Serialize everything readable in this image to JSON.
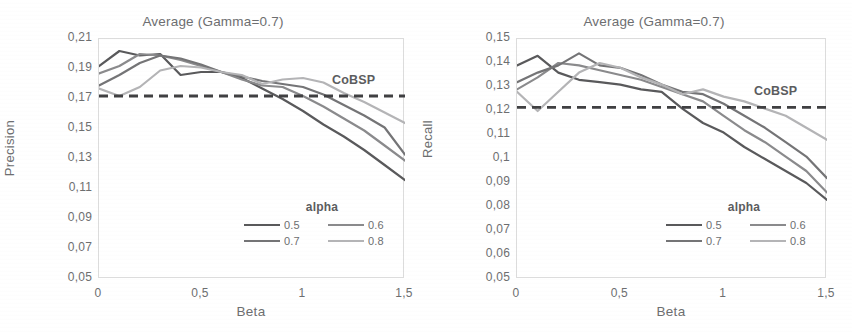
{
  "figure": {
    "panels": [
      {
        "id": "precision-panel",
        "title": "Average (Gamma=0.7)",
        "ylabel": "Precision",
        "xlabel": "Beta",
        "baseline_label": "CoBSP",
        "legend_title": "alpha"
      },
      {
        "id": "recall-panel",
        "title": "Average (Gamma=0.7)",
        "ylabel": "Recall",
        "xlabel": "Beta",
        "baseline_label": "CoBSP",
        "legend_title": "alpha"
      }
    ]
  },
  "colors": {
    "series_05": "#59595b",
    "series_06": "#8a8a8c",
    "series_07": "#747476",
    "series_08": "#b4b4b6",
    "baseline": "#3f3f41",
    "axis": "#dcdcdc",
    "text": "#6d6e70"
  },
  "chart_data": [
    {
      "type": "line",
      "title": "Average (Gamma=0.7)",
      "xlabel": "Beta",
      "ylabel": "Precision",
      "xlim": [
        0,
        1.5
      ],
      "ylim": [
        0.05,
        0.21
      ],
      "xticks": [
        0,
        0.5,
        1,
        1.5
      ],
      "xticklabels": [
        "0",
        "0,5",
        "1",
        "1,5"
      ],
      "yticks": [
        0.05,
        0.07,
        0.09,
        0.11,
        0.13,
        0.15,
        0.17,
        0.19,
        0.21
      ],
      "yticklabels": [
        "0,05",
        "0,07",
        "0,09",
        "0,11",
        "0,13",
        "0,15",
        "0,17",
        "0,19",
        "0,21"
      ],
      "grid": false,
      "legend_title": "alpha",
      "legend_position": "lower right",
      "annotations": [
        {
          "text": "CoBSP",
          "type": "baseline-label",
          "y": 0.172
        }
      ],
      "baseline": {
        "label": "CoBSP",
        "value": 0.172,
        "style": "dashed"
      },
      "x": [
        0,
        0.1,
        0.2,
        0.3,
        0.4,
        0.5,
        0.6,
        0.7,
        0.8,
        0.9,
        1.0,
        1.1,
        1.2,
        1.3,
        1.4,
        1.5
      ],
      "series": [
        {
          "name": "0.5",
          "color": "#59595b",
          "values": [
            0.192,
            0.202,
            0.199,
            0.2,
            0.186,
            0.188,
            0.188,
            0.184,
            0.177,
            0.17,
            0.162,
            0.153,
            0.145,
            0.136,
            0.126,
            0.116
          ]
        },
        {
          "name": "0.6",
          "color": "#8a8a8c",
          "values": [
            0.187,
            0.192,
            0.2,
            0.199,
            0.196,
            0.192,
            0.188,
            0.183,
            0.179,
            0.178,
            0.172,
            0.165,
            0.157,
            0.149,
            0.139,
            0.129
          ]
        },
        {
          "name": "0.7",
          "color": "#747476",
          "values": [
            0.179,
            0.186,
            0.194,
            0.199,
            0.197,
            0.193,
            0.188,
            0.185,
            0.182,
            0.18,
            0.178,
            0.173,
            0.166,
            0.159,
            0.151,
            0.133
          ]
        },
        {
          "name": "0.8",
          "color": "#b4b4b6",
          "values": [
            0.177,
            0.172,
            0.178,
            0.189,
            0.192,
            0.191,
            0.188,
            0.186,
            0.18,
            0.183,
            0.184,
            0.181,
            0.174,
            0.168,
            0.161,
            0.154
          ]
        }
      ]
    },
    {
      "type": "line",
      "title": "Average (Gamma=0.7)",
      "xlabel": "Beta",
      "ylabel": "Recall",
      "xlim": [
        0,
        1.5
      ],
      "ylim": [
        0.05,
        0.15
      ],
      "xticks": [
        0,
        0.5,
        1,
        1.5
      ],
      "xticklabels": [
        "0",
        "0,5",
        "1",
        "1,5"
      ],
      "yticks": [
        0.05,
        0.06,
        0.07,
        0.08,
        0.09,
        0.1,
        0.11,
        0.12,
        0.13,
        0.14,
        0.15
      ],
      "yticklabels": [
        "0,05",
        "0,06",
        "0,07",
        "0,08",
        "0,09",
        "0,1",
        "0,11",
        "0,12",
        "0,13",
        "0,14",
        "0,15"
      ],
      "grid": false,
      "legend_title": "alpha",
      "legend_position": "lower right",
      "annotations": [
        {
          "text": "CoBSP",
          "type": "baseline-label",
          "y": 0.1215
        }
      ],
      "baseline": {
        "label": "CoBSP",
        "value": 0.1215,
        "style": "dashed"
      },
      "x": [
        0,
        0.1,
        0.2,
        0.3,
        0.4,
        0.5,
        0.6,
        0.7,
        0.8,
        0.9,
        1.0,
        1.1,
        1.2,
        1.3,
        1.4,
        1.5
      ],
      "series": [
        {
          "name": "0.5",
          "color": "#59595b",
          "values": [
            0.139,
            0.143,
            0.136,
            0.133,
            0.132,
            0.131,
            0.129,
            0.128,
            0.121,
            0.115,
            0.111,
            0.105,
            0.1,
            0.095,
            0.09,
            0.083
          ]
        },
        {
          "name": "0.6",
          "color": "#8a8a8c",
          "values": [
            0.129,
            0.134,
            0.14,
            0.139,
            0.137,
            0.135,
            0.133,
            0.13,
            0.127,
            0.124,
            0.118,
            0.112,
            0.107,
            0.101,
            0.095,
            0.086
          ]
        },
        {
          "name": "0.7",
          "color": "#747476",
          "values": [
            0.132,
            0.136,
            0.139,
            0.144,
            0.139,
            0.138,
            0.135,
            0.131,
            0.128,
            0.127,
            0.123,
            0.118,
            0.113,
            0.107,
            0.101,
            0.092
          ]
        },
        {
          "name": "0.8",
          "color": "#b4b4b6",
          "values": [
            0.128,
            0.12,
            0.128,
            0.136,
            0.14,
            0.138,
            0.134,
            0.131,
            0.127,
            0.129,
            0.126,
            0.124,
            0.121,
            0.118,
            0.113,
            0.108
          ]
        }
      ]
    }
  ]
}
